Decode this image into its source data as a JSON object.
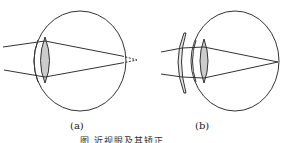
{
  "figure": {
    "panels": [
      {
        "id": "a",
        "label": "(a)",
        "description": "myopic eye: parallel rays focus in front of retina, dashed extensions converge behind"
      },
      {
        "id": "b",
        "label": "(b)",
        "description": "myopia corrected with concave lens: rays focus on retina"
      }
    ],
    "caption": "图  近视眼及其矫正",
    "colors": {
      "stroke": "#333333",
      "lens_fill": "#cccccc",
      "background": "#ffffff"
    }
  }
}
